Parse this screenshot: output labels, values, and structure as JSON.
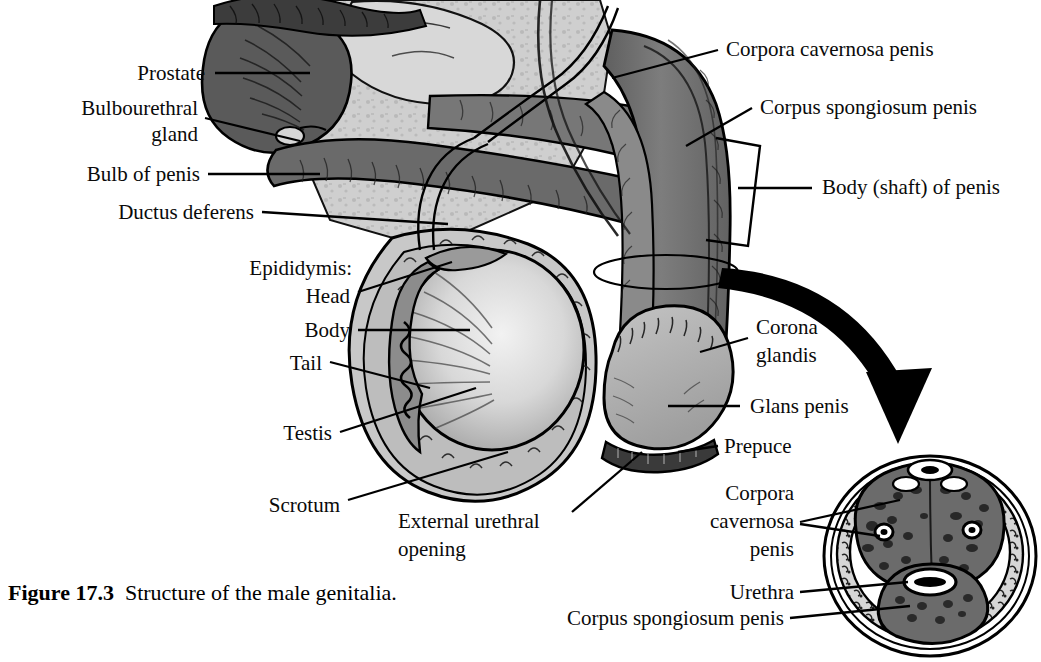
{
  "figure": {
    "number": "Figure 17.3",
    "caption": "Structure of the male genitalia.",
    "type": "anatomical-illustration",
    "style": "grayscale line art with hatching",
    "colors": {
      "background": "#ffffff",
      "text": "#0a0a0a",
      "leader_line": "#000000",
      "erectile_tissue_dark": "#6e6e6e",
      "erectile_tissue_mid": "#808080",
      "prostate_dark": "#5a5a5a",
      "scrotum_light": "#c8c8c8",
      "testis_light": "#dcdcdc",
      "glans_mid": "#b4b4b4",
      "inset_outer": "#d2d2d2",
      "inset_corpora": "#6b6b6b",
      "arrow": "#000000"
    }
  },
  "labels_left": [
    {
      "id": "prostate",
      "text": "Prostate",
      "lines": [
        "Prostate"
      ]
    },
    {
      "id": "bulbourethral-gland",
      "text": "Bulbourethral gland",
      "lines": [
        "Bulbourethral",
        "gland"
      ]
    },
    {
      "id": "bulb-of-penis",
      "text": "Bulb of penis",
      "lines": [
        "Bulb of penis"
      ]
    },
    {
      "id": "ductus-deferens",
      "text": "Ductus deferens",
      "lines": [
        "Ductus deferens"
      ]
    },
    {
      "id": "epididymis",
      "text": "Epididymis:",
      "lines": [
        "Epididymis:"
      ]
    },
    {
      "id": "epididymis-head",
      "text": "Head",
      "lines": [
        "Head"
      ]
    },
    {
      "id": "epididymis-body",
      "text": "Body",
      "lines": [
        "Body"
      ]
    },
    {
      "id": "epididymis-tail",
      "text": "Tail",
      "lines": [
        "Tail"
      ]
    },
    {
      "id": "testis",
      "text": "Testis",
      "lines": [
        "Testis"
      ]
    },
    {
      "id": "scrotum",
      "text": "Scrotum",
      "lines": [
        "Scrotum"
      ]
    }
  ],
  "labels_bottom": [
    {
      "id": "external-urethral-opening",
      "text": "External urethral opening",
      "lines": [
        "External urethral",
        "opening"
      ]
    }
  ],
  "labels_right": [
    {
      "id": "corpora-cavernosa-penis",
      "text": "Corpora cavernosa penis",
      "lines": [
        "Corpora cavernosa penis"
      ]
    },
    {
      "id": "corpus-spongiosum-penis",
      "text": "Corpus spongiosum penis",
      "lines": [
        "Corpus spongiosum penis"
      ]
    },
    {
      "id": "body-shaft-of-penis",
      "text": "Body (shaft) of penis",
      "lines": [
        "Body (shaft) of penis"
      ]
    },
    {
      "id": "corona-glandis",
      "text": "Corona glandis",
      "lines": [
        "Corona",
        "glandis"
      ]
    },
    {
      "id": "glans-penis",
      "text": "Glans penis",
      "lines": [
        "Glans penis"
      ]
    },
    {
      "id": "prepuce",
      "text": "Prepuce",
      "lines": [
        "Prepuce"
      ]
    }
  ],
  "labels_inset": [
    {
      "id": "inset-corpora-cavernosa-penis",
      "text": "Corpora cavernosa penis",
      "lines": [
        "Corpora",
        "cavernosa",
        "penis"
      ]
    },
    {
      "id": "inset-urethra",
      "text": "Urethra",
      "lines": [
        "Urethra"
      ]
    },
    {
      "id": "inset-corpus-spongiosum-penis",
      "text": "Corpus spongiosum penis",
      "lines": [
        "Corpus spongiosum penis"
      ]
    }
  ],
  "text": {
    "prostate": "Prostate",
    "bulbourethral_1": "Bulbourethral",
    "bulbourethral_2": "gland",
    "bulb_of_penis": "Bulb of penis",
    "ductus_deferens": "Ductus deferens",
    "epididymis": "Epididymis:",
    "head": "Head",
    "body": "Body",
    "tail": "Tail",
    "testis": "Testis",
    "scrotum": "Scrotum",
    "ext_ureth_1": "External urethral",
    "ext_ureth_2": "opening",
    "corpora_cavernosa_penis": "Corpora cavernosa penis",
    "corpus_spongiosum_penis": "Corpus spongiosum penis",
    "body_shaft_of_penis": "Body (shaft) of penis",
    "corona_1": "Corona",
    "corona_2": "glandis",
    "glans_penis": "Glans penis",
    "prepuce": "Prepuce",
    "inset_cc_1": "Corpora",
    "inset_cc_2": "cavernosa",
    "inset_cc_3": "penis",
    "inset_urethra": "Urethra",
    "inset_cs": "Corpus spongiosum penis",
    "figure_number": "Figure 17.3",
    "figure_caption": "Structure of the male genitalia."
  }
}
